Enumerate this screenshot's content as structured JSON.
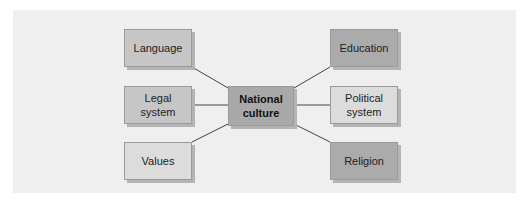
{
  "diagram": {
    "center": {
      "label_line1": "National",
      "label_line2": "culture"
    },
    "left": [
      {
        "label_line1": "Language",
        "label_line2": ""
      },
      {
        "label_line1": "Legal",
        "label_line2": "system"
      },
      {
        "label_line1": "Values",
        "label_line2": ""
      }
    ],
    "right": [
      {
        "label_line1": "Education",
        "label_line2": ""
      },
      {
        "label_line1": "Political",
        "label_line2": "system"
      },
      {
        "label_line1": "Religion",
        "label_line2": ""
      }
    ]
  }
}
